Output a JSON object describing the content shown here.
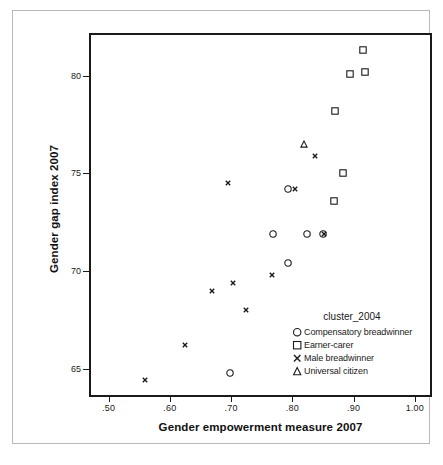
{
  "chart_data": {
    "type": "scatter",
    "title": "",
    "xlabel": "Gender empowerment measure 2007",
    "ylabel": "Gender gap index 2007",
    "xlim": [
      0.468,
      1.028
    ],
    "ylim": [
      63.55,
      82.19
    ],
    "xticks": [
      0.5,
      0.6,
      0.7,
      0.8,
      0.9,
      1.0
    ],
    "xticklabels": [
      ".50",
      ".60",
      ".70",
      ".80",
      ".90",
      "1.00"
    ],
    "yticks": [
      65,
      70,
      75,
      80
    ],
    "yticklabels": [
      "65",
      "70",
      "75",
      "80"
    ],
    "grid": false,
    "legend_position": "inside-lower-right",
    "legend_title": "cluster_2004",
    "series": [
      {
        "name": "Compensatory breadwinner",
        "marker": "circle",
        "points": [
          [
            0.79,
            74.3
          ],
          [
            0.82,
            72.0
          ],
          [
            0.847,
            72.0
          ],
          [
            0.789,
            70.5
          ],
          [
            0.765,
            72.0
          ],
          [
            0.695,
            64.9
          ]
        ]
      },
      {
        "name": "Earner-carer",
        "marker": "square",
        "points": [
          [
            0.912,
            81.4
          ],
          [
            0.891,
            80.2
          ],
          [
            0.915,
            80.3
          ],
          [
            0.866,
            78.3
          ],
          [
            0.879,
            75.1
          ],
          [
            0.864,
            73.7
          ]
        ]
      },
      {
        "name": "Male breadwinner",
        "marker": "x",
        "points": [
          [
            0.834,
            76.0
          ],
          [
            0.801,
            74.3
          ],
          [
            0.848,
            72.0
          ],
          [
            0.691,
            74.6
          ],
          [
            0.764,
            69.9
          ],
          [
            0.7,
            69.5
          ],
          [
            0.665,
            69.1
          ],
          [
            0.721,
            68.1
          ],
          [
            0.622,
            66.3
          ],
          [
            0.556,
            64.5
          ]
        ]
      },
      {
        "name": "Universal citizen",
        "marker": "triangle",
        "points": [
          [
            0.816,
            76.6
          ]
        ]
      }
    ]
  },
  "legend": {
    "title": "cluster_2004",
    "items": [
      {
        "glyph": "circle-icon",
        "label": "Compensatory breadwinner"
      },
      {
        "glyph": "square-icon",
        "label": "Earner-carer"
      },
      {
        "glyph": "x-icon",
        "label": "Male breadwinner"
      },
      {
        "glyph": "triangle-icon",
        "label": "Universal citizen"
      }
    ]
  }
}
